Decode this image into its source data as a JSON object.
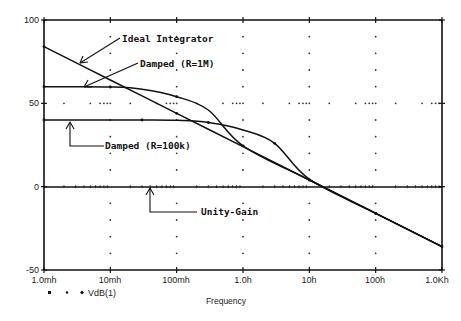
{
  "chart_data": {
    "type": "line",
    "title": "",
    "xlabel": "Frequency",
    "ylabel": "",
    "x_scale": "log",
    "x_ticks": [
      "1.0mh",
      "10mh",
      "100mh",
      "1.0h",
      "10h",
      "100h",
      "1.0Kh"
    ],
    "x_tick_values": [
      0.001,
      0.01,
      0.1,
      1,
      10,
      100,
      1000
    ],
    "y_ticks": [
      "100",
      "50",
      "0",
      "-50"
    ],
    "y_tick_values": [
      100,
      50,
      0,
      -50
    ],
    "ylim": [
      -50,
      100
    ],
    "xlim": [
      0.001,
      1000
    ],
    "grid": "dotted",
    "legend": {
      "position": "bottom-left",
      "entries": [
        "VdB(1)"
      ]
    },
    "series": [
      {
        "name": "Ideal Integrator",
        "x": [
          0.001,
          0.01,
          0.1,
          1,
          10,
          100,
          1000
        ],
        "values": [
          84,
          64,
          44,
          24,
          4,
          -16,
          -36
        ]
      },
      {
        "name": "Damped (R=1M)",
        "x": [
          0.001,
          0.003,
          0.01,
          0.03,
          0.1,
          0.3,
          1,
          10,
          100,
          1000
        ],
        "values": [
          60,
          60,
          59.8,
          58.5,
          54,
          46,
          24.5,
          4,
          -16,
          -36
        ]
      },
      {
        "name": "Damped (R=100k)",
        "x": [
          0.001,
          0.01,
          0.03,
          0.1,
          0.3,
          1,
          3,
          10,
          100,
          1000
        ],
        "values": [
          40,
          40,
          40,
          39.8,
          38.5,
          34,
          26,
          4.5,
          -16,
          -36
        ]
      },
      {
        "name": "Unity-Gain",
        "x": [
          0.001,
          1000
        ],
        "values": [
          0,
          0
        ]
      }
    ],
    "annotations": [
      {
        "text": "Ideal Integrator",
        "target": "Ideal Integrator"
      },
      {
        "text": "Damped (R=1M)",
        "target": "Damped (R=1M)"
      },
      {
        "text": "Damped (R=100k)",
        "target": "Damped (R=100k)"
      },
      {
        "text": "Unity-Gain",
        "target": "Unity-Gain"
      }
    ]
  },
  "labels": {
    "y": [
      "100",
      "50",
      "0",
      "-50"
    ],
    "x": [
      "1.0mh",
      "10mh",
      "100mh",
      "1.0h",
      "10h",
      "100h",
      "1.0Kh"
    ],
    "xaxis_title": "Frequency",
    "legend": "VdB(1)",
    "anno_ideal": "Ideal Integrator",
    "anno_1m": "Damped (R=1M)",
    "anno_100k": "Damped (R=100k)",
    "anno_unity": "Unity-Gain"
  },
  "colors": {
    "line": "#111111",
    "grid": "#333333",
    "background": "#ffffff"
  }
}
